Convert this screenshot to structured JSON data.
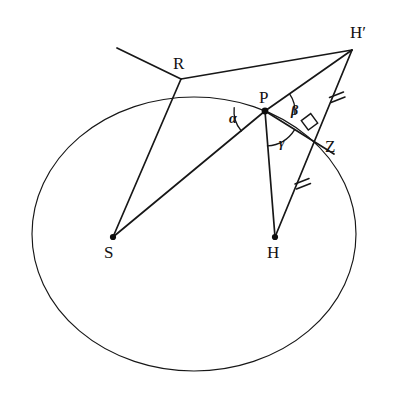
{
  "figure": {
    "kind": "euclidean-geometry-diagram",
    "background_color": "#ffffff",
    "ink_color": "#171717",
    "width": 393,
    "height": 399
  },
  "labels": {
    "point_S": "S",
    "point_H": "H",
    "point_P": "P",
    "point_R": "R",
    "point_H_prime": "H′",
    "point_Z": "Z",
    "angle_alpha": "α",
    "angle_beta": "β",
    "angle_gamma": "γ"
  },
  "points": {
    "S": {
      "x": 113,
      "y": 237,
      "label": "S",
      "label_x": 104,
      "label_y": 244,
      "dot": true
    },
    "H": {
      "x": 275,
      "y": 237,
      "label": "H",
      "label_x": 267,
      "label_y": 244,
      "dot": true
    },
    "P": {
      "x": 265,
      "y": 111,
      "label": "P",
      "label_x": 259,
      "label_y": 89,
      "dot": true
    },
    "R": {
      "x": 181,
      "y": 79,
      "label": "R",
      "label_x": 173,
      "label_y": 55,
      "dot": false
    },
    "Hprime": {
      "x": 352,
      "y": 50,
      "label": "H′",
      "label_x": 350,
      "label_y": 24,
      "dot": false
    },
    "Z": {
      "x": 320,
      "y": 144,
      "label": "Z",
      "label_x": 325,
      "label_y": 138,
      "dot": false
    }
  },
  "ellipse": {
    "cx": 194,
    "cy": 234,
    "rx": 162,
    "ry": 137,
    "rotation_deg": 0,
    "stroke_width": 1.15
  },
  "segments": [
    {
      "name": "ray-through-R-upper-left",
      "from": [
        117,
        48
      ],
      "to": [
        181,
        79
      ]
    },
    {
      "name": "segment-R-to-S",
      "from": [
        181,
        79
      ],
      "to": [
        113,
        237
      ]
    },
    {
      "name": "segment-R-to-H-prime",
      "from": [
        181,
        79
      ],
      "to": [
        352,
        50
      ]
    },
    {
      "name": "segment-S-to-P",
      "from": [
        113,
        237
      ],
      "to": [
        265,
        111
      ]
    },
    {
      "name": "segment-P-to-H-prime",
      "from": [
        265,
        111
      ],
      "to": [
        352,
        50
      ]
    },
    {
      "name": "segment-P-to-H",
      "from": [
        265,
        111
      ],
      "to": [
        275,
        237
      ]
    },
    {
      "name": "segment-P-to-Z",
      "from": [
        265,
        111
      ],
      "to": [
        334,
        154
      ]
    },
    {
      "name": "segment-H-prime-to-H",
      "from": [
        352,
        50
      ],
      "to": [
        275,
        237
      ]
    }
  ],
  "angle_arcs": [
    {
      "name": "arc-alpha",
      "vertex": "P",
      "radius": 31,
      "start_deg": 140,
      "end_deg": 186,
      "label": "α",
      "label_x": 229,
      "label_y": 112
    },
    {
      "name": "arc-beta",
      "vertex": "P",
      "radius": 30,
      "start_deg": -35,
      "end_deg": 6,
      "label": "β",
      "label_x": 291,
      "label_y": 104
    },
    {
      "name": "arc-gamma",
      "vertex": "P",
      "radius": 35,
      "start_deg": 32,
      "end_deg": 86,
      "label": "γ",
      "label_x": 279,
      "label_y": 136
    }
  ],
  "marks": {
    "right_angle": {
      "name": "right-angle-square-at-Z",
      "x": 305,
      "y": 118,
      "size": 13
    },
    "tick_upper": {
      "name": "congruence-tick-on-H-prime-Z",
      "x": 336,
      "y": 97,
      "count": 2
    },
    "tick_lower": {
      "name": "congruence-tick-on-Z-H",
      "x": 302,
      "y": 182,
      "count": 2
    }
  }
}
